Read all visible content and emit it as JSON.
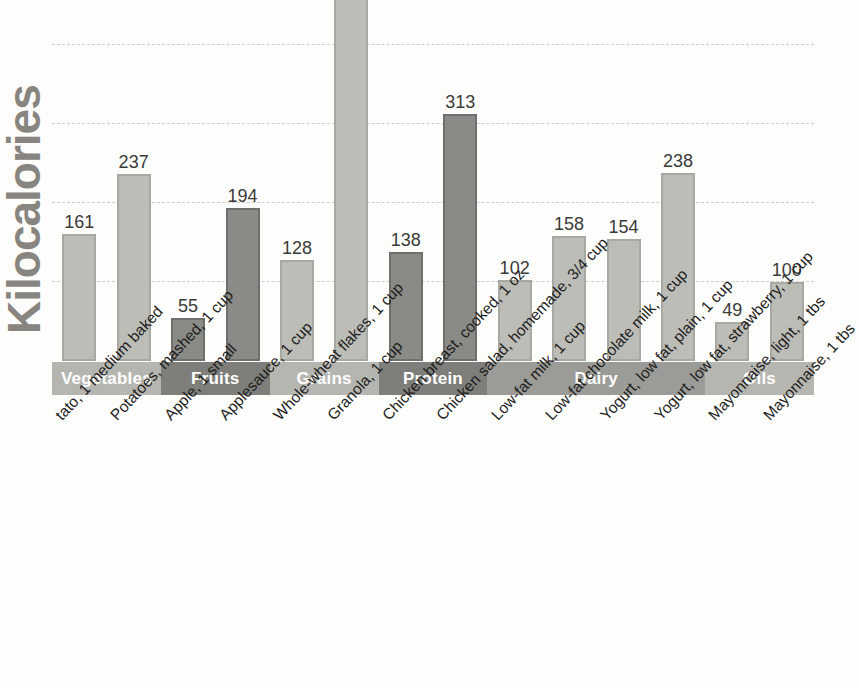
{
  "chart_data": {
    "type": "bar",
    "title": "",
    "subtitle": "",
    "xlabel": "",
    "ylabel": "Kilocalories",
    "ylim": [
      0,
      500
    ],
    "grid": true,
    "gridlines": [
      100,
      200,
      300,
      400
    ],
    "legend": "none",
    "categories": [
      "Potato, 1 medium baked",
      "Potatoes, mashed, 1 cup",
      "Apple, 1 small",
      "Applesauce, 1 cup",
      "Whole-wheat flakes, 1 cup",
      "Granola, 1 cup",
      "Chicken breast, cooked, 1 oz",
      "Chicken salad, homemade, 3/4 cup",
      "Low-fat milk, 1 cup",
      "Low-fat chocolate milk, 1 cup",
      "Yogurt, low fat, plain, 1 cup",
      "Yogurt, low fat, strawberry, 1 cup",
      "Mayonnaise, light, 1 tbs",
      "Mayonnaise, 1 tbs"
    ],
    "values": [
      161,
      237,
      55,
      194,
      128,
      464,
      138,
      313,
      102,
      158,
      154,
      238,
      49,
      100
    ]
  },
  "axis": {
    "y_title": "Kilocalories"
  },
  "bars": [
    {
      "label": "Potato, 1 medium baked",
      "value": 161,
      "value_text": "161",
      "shade": "light",
      "group": "Vegetables"
    },
    {
      "label": "Potatoes, mashed, 1 cup",
      "value": 237,
      "value_text": "237",
      "shade": "light",
      "group": "Vegetables"
    },
    {
      "label": "Apple, 1 small",
      "value": 55,
      "value_text": "55",
      "shade": "dark",
      "group": "Fruits"
    },
    {
      "label": "Applesauce, 1 cup",
      "value": 194,
      "value_text": "194",
      "shade": "dark",
      "group": "Fruits"
    },
    {
      "label": "Whole-wheat flakes, 1 cup",
      "value": 128,
      "value_text": "128",
      "shade": "light",
      "group": "Grains"
    },
    {
      "label": "Granola, 1 cup",
      "value": 464,
      "value_text": "464",
      "shade": "light",
      "group": "Grains"
    },
    {
      "label": "Chicken breast, cooked, 1 oz",
      "value": 138,
      "value_text": "138",
      "shade": "dark",
      "group": "Protein"
    },
    {
      "label": "Chicken salad, homemade, 3/4 cup",
      "value": 313,
      "value_text": "313",
      "shade": "dark",
      "group": "Protein"
    },
    {
      "label": "Low-fat milk, 1 cup",
      "value": 102,
      "value_text": "102",
      "shade": "light",
      "group": "Dairy"
    },
    {
      "label": "Low-fat chocolate milk, 1 cup",
      "value": 158,
      "value_text": "158",
      "shade": "light",
      "group": "Dairy"
    },
    {
      "label": "Yogurt, low fat, plain, 1 cup",
      "value": 154,
      "value_text": "154",
      "shade": "light",
      "group": "Dairy"
    },
    {
      "label": "Yogurt, low fat, strawberry, 1 cup",
      "value": 238,
      "value_text": "238",
      "shade": "light",
      "group": "Dairy"
    },
    {
      "label": "Mayonnaise, light, 1 tbs",
      "value": 49,
      "value_text": "49",
      "shade": "light",
      "group": "Oils"
    },
    {
      "label": "Mayonnaise, 1 tbs",
      "value": 100,
      "value_text": "100",
      "shade": "light",
      "group": "Oils"
    }
  ],
  "tick_labels": [
    {
      "text": "tato, 1 medium baked"
    },
    {
      "text": "Potatoes, mashed, 1 cup"
    },
    {
      "text": "Apple, 1 small"
    },
    {
      "text": "Applesauce, 1 cup"
    },
    {
      "text": "Whole-wheat flakes, 1 cup"
    },
    {
      "text": "Granola, 1 cup"
    },
    {
      "text": "Chicken breast, cooked, 1 oz"
    },
    {
      "text": "Chicken salad, homemade, 3/4 cup"
    },
    {
      "text": "Low-fat milk, 1 cup"
    },
    {
      "text": "Low-fat chocolate milk, 1 cup"
    },
    {
      "text": "Yogurt, low fat, plain, 1 cup"
    },
    {
      "text": "Yogurt, low fat, strawberry, 1 cup"
    },
    {
      "text": "Mayonnaise, light, 1 tbs"
    },
    {
      "text": "Mayonnaise, 1 tbs"
    }
  ],
  "groups": [
    {
      "label": "Vegetables",
      "shade": "light",
      "span": 2
    },
    {
      "label": "Fruits",
      "shade": "dark",
      "span": 2
    },
    {
      "label": "Grains",
      "shade": "light",
      "span": 2
    },
    {
      "label": "Protein",
      "shade": "dark",
      "span": 2
    },
    {
      "label": "Dairy",
      "shade": "mid",
      "span": 4
    },
    {
      "label": "Oils",
      "shade": "light",
      "span": 2
    }
  ],
  "colors": {
    "bar_light_fill": "#bdbdb8",
    "bar_light_border": "#a8a8a2",
    "bar_dark_fill": "#8a8a86",
    "bar_dark_border": "#6f6f6b",
    "band_light": "#b6b6b1",
    "band_mid": "#9b9b97",
    "band_dark": "#7e7e7a",
    "gridline": "#cfcdc8",
    "value_text": "#3a3a38",
    "axis_title": "#888580",
    "tick_text": "#1d1d1c",
    "background": "#fdfdfc"
  }
}
